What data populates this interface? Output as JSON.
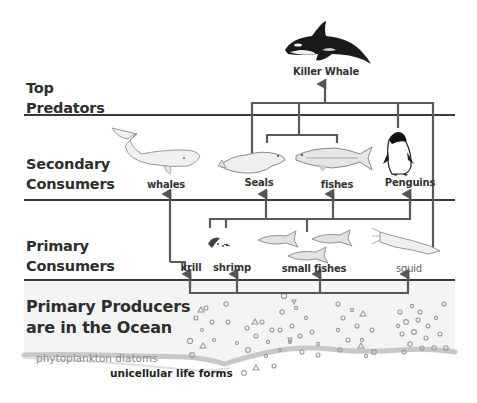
{
  "diagram": {
    "levels": [
      {
        "id": "top",
        "label_lines": [
          "Top",
          "Predators"
        ]
      },
      {
        "id": "secondary",
        "label_lines": [
          "Secondary",
          "Consumers"
        ]
      },
      {
        "id": "primary",
        "label_lines": [
          "Primary",
          "Consumers"
        ]
      },
      {
        "id": "producers",
        "label_lines": [
          "Primary Producers",
          "are in the Ocean"
        ]
      }
    ],
    "organisms": {
      "killer_whale": "Killer Whale",
      "whales": "whales",
      "seals": "Seals",
      "fishes": "fishes",
      "penguins": "Penguins",
      "krill": "krill",
      "shrimp": "shrimp",
      "small_fishes": "small fishes",
      "squid": "squid"
    },
    "producer_notes": {
      "phytoplankton": "phytoplankton diatoms",
      "unicellular": "unicellular life forms"
    },
    "edges": [
      {
        "from": "seals",
        "to": "killer_whale"
      },
      {
        "from": "fishes",
        "to": "killer_whale"
      },
      {
        "from": "penguins",
        "to": "killer_whale"
      },
      {
        "from": "squid",
        "to": "killer_whale"
      },
      {
        "from": "krill",
        "to": "whales"
      },
      {
        "from": "krill",
        "to": "seals"
      },
      {
        "from": "shrimp",
        "to": "seals"
      },
      {
        "from": "small_fishes",
        "to": "seals"
      },
      {
        "from": "krill",
        "to": "fishes"
      },
      {
        "from": "shrimp",
        "to": "fishes"
      },
      {
        "from": "small_fishes",
        "to": "fishes"
      },
      {
        "from": "krill",
        "to": "penguins"
      },
      {
        "from": "shrimp",
        "to": "penguins"
      },
      {
        "from": "small_fishes",
        "to": "penguins"
      },
      {
        "from": "producers",
        "to": "krill"
      },
      {
        "from": "producers",
        "to": "shrimp"
      },
      {
        "from": "producers",
        "to": "small_fishes"
      },
      {
        "from": "producers",
        "to": "squid"
      }
    ],
    "colors": {
      "line": "#5a5a5a",
      "divider": "#3a3a3a",
      "text": "#2e2e2e",
      "ocean": "#f4f4f4",
      "seabed": "#c8c8c8",
      "particles": "#9a9a9a"
    }
  }
}
